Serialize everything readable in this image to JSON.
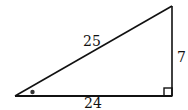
{
  "diagram": {
    "type": "right-triangle",
    "labels": {
      "hypotenuse": "25",
      "base": "24",
      "height": "7"
    },
    "markers": {
      "right_angle": "right-angle-square",
      "angle_mark": "dot"
    },
    "colors": {
      "stroke": "#111111",
      "background": "#ffffff"
    }
  }
}
